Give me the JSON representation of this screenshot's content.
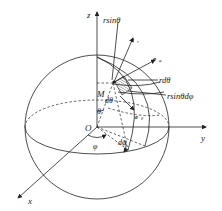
{
  "figure": {
    "type": "spherical-coordinates-surface-element",
    "axes": {
      "x": "x",
      "y": "y",
      "z": "z",
      "origin": "O"
    },
    "point": "M",
    "labels": {
      "r_sin_theta": "rsinθ",
      "e_r": "e",
      "e_r_sub": "r",
      "e_phi": "e",
      "e_phi_sub": "φ",
      "e_theta": "e",
      "e_theta_sub": "θ",
      "r_dtheta": "rdθ",
      "r_sin_theta_dphi": "rsinθdφ",
      "d_theta": "dθ",
      "theta": "θ",
      "phi": "φ",
      "d_phi": "dφ"
    }
  }
}
